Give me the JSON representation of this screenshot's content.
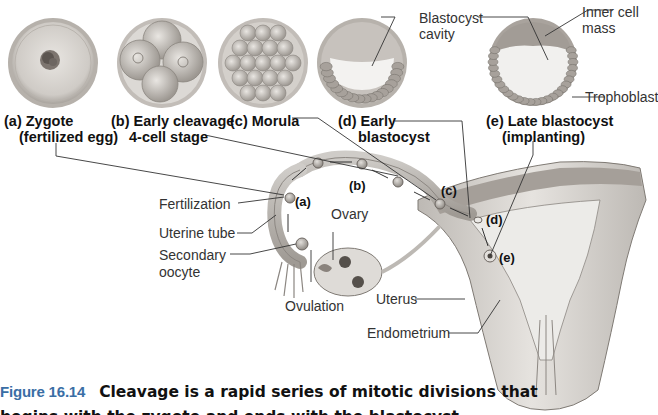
{
  "figure": {
    "number_label": "Figure 16.14",
    "caption_line1": "Cleavage is a rapid series of mitotic divisions that",
    "caption_line2": "begins with the zygote and ends with the blastocyst."
  },
  "stages": [
    {
      "id": "a",
      "label_line1": "(a) Zygote",
      "label_line2": "(fertilized egg)"
    },
    {
      "id": "b",
      "label_line1": "(b) Early cleavage",
      "label_line2": "4-cell stage"
    },
    {
      "id": "c",
      "label_line1": "(c) Morula",
      "label_line2": ""
    },
    {
      "id": "d",
      "label_line1": "(d) Early",
      "label_line2": "blastocyst"
    },
    {
      "id": "e",
      "label_line1": "(e) Late blastocyst",
      "label_line2": "(implanting)"
    }
  ],
  "blastocyst_labels": {
    "cavity_line1": "Blastocyst",
    "cavity_line2": "cavity",
    "inner_line1": "Inner cell",
    "inner_line2": "mass",
    "trophoblast": "Trophoblast"
  },
  "anatomy_labels": {
    "fertilization": "Fertilization",
    "uterine_tube": "Uterine tube",
    "secondary_oocyte_line1": "Secondary",
    "secondary_oocyte_line2": "oocyte",
    "ovary": "Ovary",
    "ovulation": "Ovulation",
    "uterus": "Uterus",
    "endometrium": "Endometrium"
  },
  "path_markers": [
    "(a)",
    "(b)",
    "(c)",
    "(d)",
    "(e)"
  ],
  "colors": {
    "figure_number": "#3a6ea5",
    "tissue": "#d9d6d2",
    "tissue_dark": "#8c8782",
    "cell": "#b7b2ac",
    "leader": "#333333"
  }
}
